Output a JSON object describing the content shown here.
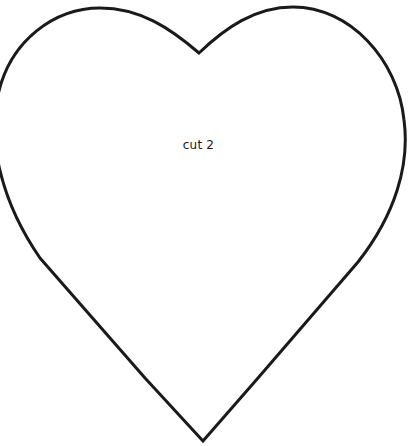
{
  "template": {
    "shape": "heart",
    "label": "cut 2",
    "stroke_color": "#1a1a1a",
    "fill_color": "#ffffff",
    "background_color": "#ffffff"
  }
}
